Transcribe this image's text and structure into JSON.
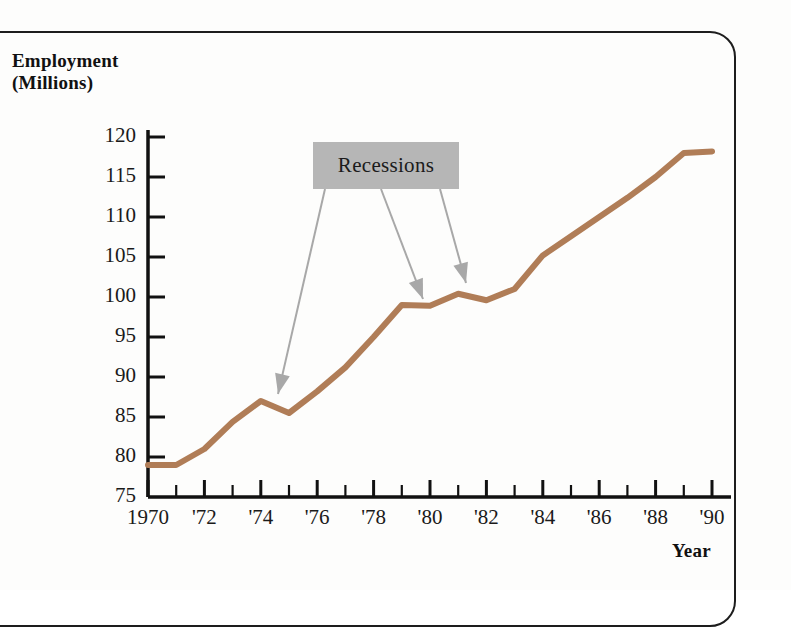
{
  "chart_data": {
    "type": "line",
    "title": "",
    "xlabel": "Year",
    "ylabel": "Employment (Millions)",
    "ylim": [
      75,
      122
    ],
    "xlim": [
      1970,
      1990
    ],
    "grid": false,
    "legend_position": "none",
    "line_color": "#b07d57",
    "x": [
      1970,
      1971,
      1972,
      1973,
      1974,
      1975,
      1976,
      1977,
      1978,
      1979,
      1980,
      1981,
      1982,
      1983,
      1984,
      1985,
      1986,
      1987,
      1988,
      1989,
      1990
    ],
    "values": [
      79.0,
      79.0,
      81.0,
      84.4,
      87.0,
      85.5,
      88.2,
      91.2,
      95.0,
      99.0,
      98.9,
      100.4,
      99.6,
      101.0,
      105.2,
      107.6,
      110.0,
      112.4,
      115.0,
      118.0,
      118.2
    ],
    "y_ticks": [
      120,
      115,
      110,
      105,
      100,
      95,
      90,
      85,
      80,
      75
    ],
    "x_ticks": [
      1970,
      1972,
      1974,
      1976,
      1978,
      1980,
      1982,
      1984,
      1986,
      1988,
      1990
    ],
    "x_tick_labels": [
      "1970",
      "'72",
      "'74",
      "'76",
      "'78",
      "'80",
      "'82",
      "'84",
      "'86",
      "'88",
      "'90"
    ],
    "annotations": [
      {
        "label": "Recessions",
        "box_color": "#b6b6b6",
        "arrow_color": "#a8a8a8",
        "targets": [
          1975,
          1980,
          1982
        ]
      }
    ]
  },
  "axes": {
    "y_title_line1": "Employment",
    "y_title_line2": "(Millions)",
    "x_title": "Year"
  },
  "annotation": {
    "recessions_label": "Recessions"
  }
}
